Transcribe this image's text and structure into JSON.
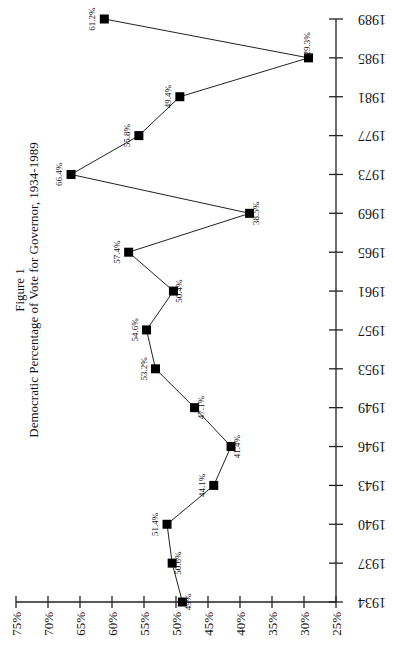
{
  "chart_data": {
    "type": "line",
    "title": "Figure 1",
    "subtitle": "Democratic Percentage of Vote for Governor, 1934-1989",
    "xlabel": "",
    "ylabel": "",
    "categories": [
      "1934",
      "1937",
      "1940",
      "1943",
      "1946",
      "1949",
      "1953",
      "1957",
      "1961",
      "1965",
      "1969",
      "1973",
      "1977",
      "1981",
      "1985",
      "1989"
    ],
    "series": [
      {
        "name": "Democratic Percentage of Vote",
        "values": [
          49.0,
          50.6,
          51.4,
          44.1,
          41.4,
          47.1,
          53.2,
          54.6,
          50.4,
          57.4,
          38.5,
          66.4,
          55.8,
          49.4,
          29.3,
          61.2
        ],
        "labels": [
          "49%",
          "50.6%",
          "51.4%",
          "44.1%",
          "41.4%",
          "47.1%",
          "53.2%",
          "54.6%",
          "50.4%",
          "57.4%",
          "38.5%",
          "66.4%",
          "55.8%",
          "49.4%",
          "29.3%",
          "61.2%"
        ]
      }
    ],
    "ylim": [
      25,
      75
    ],
    "yticks": [
      "25%",
      "30%",
      "35%",
      "40%",
      "45%",
      "50%",
      "55%",
      "60%",
      "65%",
      "70%",
      "75%"
    ],
    "grid": false,
    "legend": "none",
    "orientation": "rotated-90"
  }
}
